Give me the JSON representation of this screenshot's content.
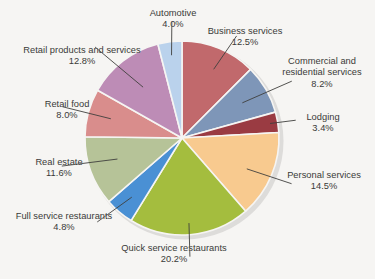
{
  "chart_data": {
    "type": "pie",
    "title": "",
    "subtitle": "",
    "xlabel": "",
    "ylabel": "",
    "legend_position": "none",
    "grid": false,
    "value_unit": "%",
    "start_angle_deg": 0,
    "direction": "clockwise",
    "total": 100.0,
    "categories": [
      "Business services",
      "Commercial and residential services",
      "Lodging",
      "Personal services",
      "Quick service restaurants",
      "Full service restaurants",
      "Real estate",
      "Retail food",
      "Retail products and services",
      "Automotive"
    ],
    "values": [
      12.5,
      8.2,
      3.4,
      14.5,
      20.2,
      4.8,
      11.6,
      8.0,
      12.8,
      4.0
    ],
    "value_labels": [
      "12.5%",
      "8.2%",
      "3.4%",
      "14.5%",
      "20.2%",
      "4.8%",
      "11.6%",
      "8.0%",
      "12.8%",
      "4.0%"
    ],
    "colors": [
      "#c1696c",
      "#7e96b8",
      "#9a3b42",
      "#f8ca8f",
      "#a4bd3e",
      "#4a90d4",
      "#b6c398",
      "#d98d8c",
      "#bd8cb6",
      "#bad2ec"
    ],
    "slices": [
      {
        "label": "Business services",
        "value": 12.5,
        "value_label": "12.5%",
        "color": "#c1696c"
      },
      {
        "label": "Commercial and residential services",
        "value": 8.2,
        "value_label": "8.2%",
        "color": "#7e96b8"
      },
      {
        "label": "Lodging",
        "value": 3.4,
        "value_label": "3.4%",
        "color": "#9a3b42"
      },
      {
        "label": "Personal services",
        "value": 14.5,
        "value_label": "14.5%",
        "color": "#f8ca8f"
      },
      {
        "label": "Quick service restaurants",
        "value": 20.2,
        "value_label": "20.2%",
        "color": "#a4bd3e"
      },
      {
        "label": "Full service restaurants",
        "value": 4.8,
        "value_label": "4.8%",
        "color": "#4a90d4"
      },
      {
        "label": "Real estate",
        "value": 11.6,
        "value_label": "11.6%",
        "color": "#b6c398"
      },
      {
        "label": "Retail food",
        "value": 8.0,
        "value_label": "8.0%",
        "color": "#d98d8c"
      },
      {
        "label": "Retail products and services",
        "value": 12.8,
        "value_label": "12.8%",
        "color": "#bd8cb6"
      },
      {
        "label": "Automotive",
        "value": 4.0,
        "value_label": "4.0%",
        "color": "#bad2ec"
      }
    ]
  },
  "labels": {
    "business_services": {
      "name": "Business services",
      "pct": "12.5%"
    },
    "commercial_and_residential_services": {
      "name": "Commercial and\nresidential services",
      "name_line1": "Commercial and",
      "name_line2": "residential services",
      "pct": "8.2%"
    },
    "lodging": {
      "name": "Lodging",
      "pct": "3.4%"
    },
    "personal_services": {
      "name": "Personal services",
      "pct": "14.5%"
    },
    "quick_service_restaurants": {
      "name": "Quick service restaurants",
      "pct": "20.2%"
    },
    "full_service_restaurants": {
      "name": "Full service restaurants",
      "pct": "4.8%"
    },
    "real_estate": {
      "name": "Real estate",
      "pct": "11.6%"
    },
    "retail_food": {
      "name": "Retail food",
      "pct": "8.0%"
    },
    "retail_products_and_services": {
      "name": "Retail products and services",
      "pct": "12.8%"
    },
    "automotive": {
      "name": "Automotive",
      "pct": "4.0%"
    }
  },
  "style": {
    "background": "#f6f5f3",
    "text_color": "#3a3a38",
    "leader_line_color": "#3f3f3d",
    "slice_border_color": "#f6f5f3",
    "shadow_color": "#c8c7c4"
  },
  "geometry": {
    "center_x": 182,
    "center_y": 138,
    "radius": 97
  }
}
